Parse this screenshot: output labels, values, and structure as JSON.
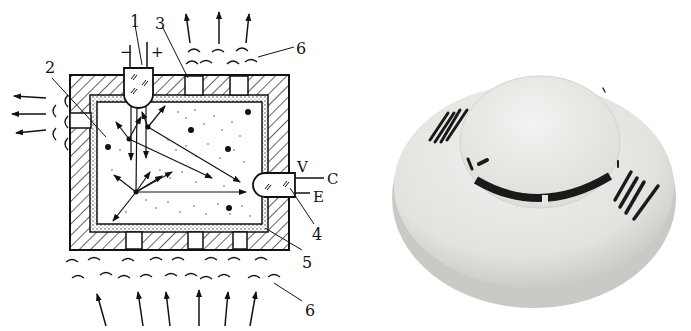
{
  "diagram": {
    "labels": {
      "l1": "1",
      "l2": "2",
      "l3": "3",
      "l4": "4",
      "l5": "5",
      "l6_top": "6",
      "l6_bottom": "6",
      "minus": "−",
      "plus": "+",
      "v": "V",
      "c": "C",
      "e": "E"
    },
    "colors": {
      "line": "#111111",
      "background": "#ffffff"
    }
  },
  "photo": {
    "subject": "Ceiling-mounted smoke detector",
    "colors": {
      "body": "#e6e6e4",
      "shadow": "#bdbdba",
      "slots": "#1a1a1a"
    }
  }
}
